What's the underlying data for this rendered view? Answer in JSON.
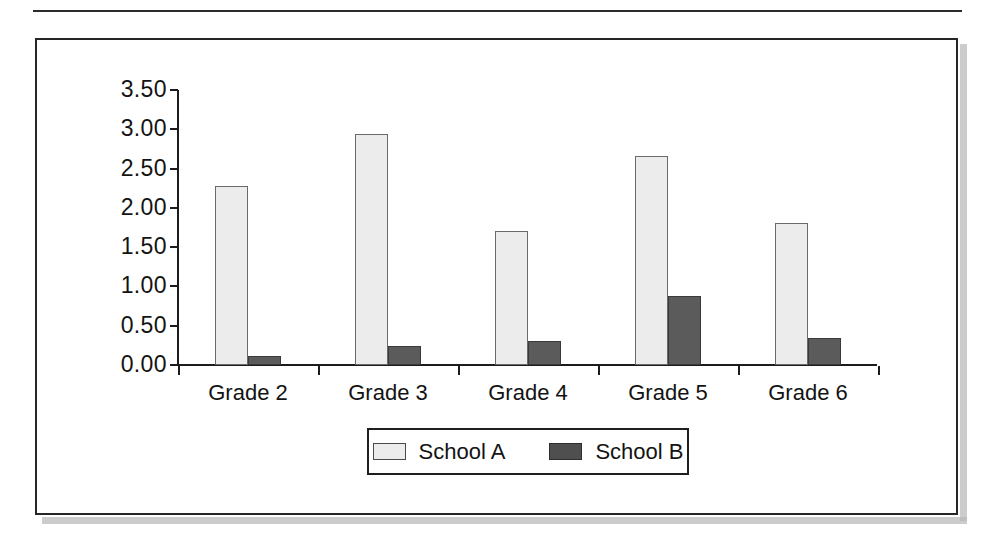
{
  "figure": {
    "frame_border_color": "#262626",
    "shadow_color": "#b8b8b8",
    "background": "#ffffff"
  },
  "legend": {
    "position": "bottom-center",
    "entries": [
      {
        "label": "School A",
        "color": "#ececec",
        "swatch": "legend-swatch-school-a"
      },
      {
        "label": "School B",
        "color": "#5b5b5b",
        "swatch": "legend-swatch-school-b"
      }
    ]
  },
  "axis": {
    "y_ticks": [
      "3.50",
      "3.00",
      "2.50",
      "2.00",
      "1.50",
      "1.00",
      "0.50",
      "0.00"
    ]
  },
  "chart_data": {
    "type": "bar",
    "title": "",
    "subtitle": "",
    "xlabel": "",
    "ylabel": "",
    "categories": [
      "Grade 2",
      "Grade 3",
      "Grade 4",
      "Grade 5",
      "Grade 6"
    ],
    "series": [
      {
        "name": "School A",
        "color": "#ececec",
        "values": [
          2.28,
          2.94,
          1.71,
          2.66,
          1.81
        ]
      },
      {
        "name": "School B",
        "color": "#5b5b5b",
        "values": [
          0.12,
          0.24,
          0.3,
          0.88,
          0.34
        ]
      }
    ],
    "ylim": [
      0.0,
      3.5
    ],
    "ytick_step": 0.5,
    "ytick_labels": [
      "0.00",
      "0.50",
      "1.00",
      "1.50",
      "2.00",
      "2.50",
      "3.00",
      "3.50"
    ],
    "xtick_labels": [
      "Grade 2",
      "Grade 3",
      "Grade 4",
      "Grade 5",
      "Grade 6"
    ],
    "grid": false,
    "legend_position": "bottom-center",
    "annotations": []
  }
}
